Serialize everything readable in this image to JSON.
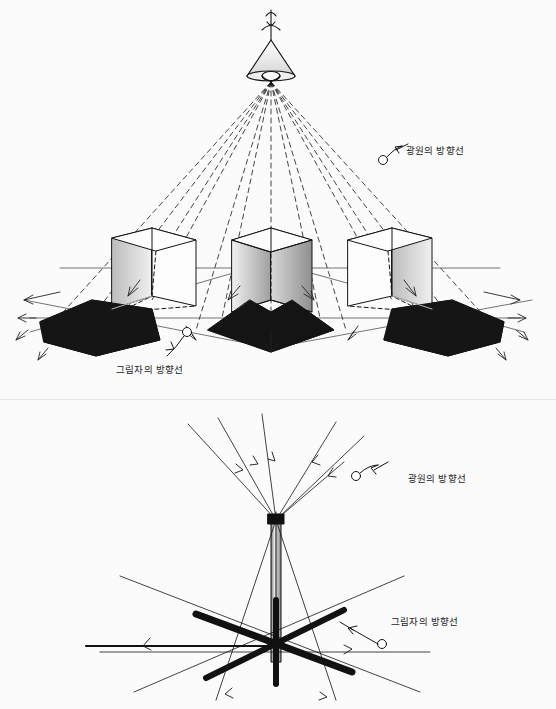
{
  "figure_top": {
    "name": "perspective-cubes-with-lamp-shadows",
    "labels": [
      {
        "id": "light-direction-top",
        "text": "광원의 방향선",
        "x": 410,
        "y": 148
      },
      {
        "id": "shadow-direction-top",
        "text": "그림자의 방향선",
        "x": 122,
        "y": 368
      }
    ]
  },
  "figure_bottom": {
    "name": "pole-shadow-direction-diagram",
    "labels": [
      {
        "id": "light-direction-bottom",
        "text": "광원의 방향선",
        "x": 412,
        "y": 477
      },
      {
        "id": "shadow-direction-bottom",
        "text": "그림자의 방향선",
        "x": 395,
        "y": 620
      }
    ]
  },
  "colors": {
    "ink": "#111111",
    "shadow_fill": "#1b1b1b",
    "cube_face_light": "#f2f2f2",
    "cube_face_mid": "#c9c9c9",
    "cube_face_dark": "#8d8d8d",
    "paper": "#fbfbfb"
  }
}
